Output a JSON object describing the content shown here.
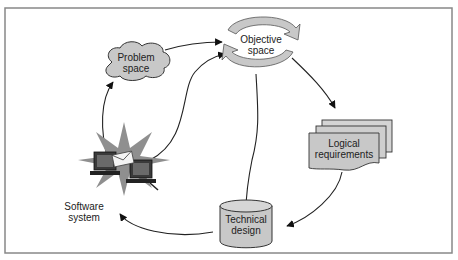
{
  "diagram": {
    "nodes": {
      "problem_space": {
        "line1": "Problem",
        "line2": "space"
      },
      "objective_space": {
        "line1": "Objective",
        "line2": "space"
      },
      "logical_requirements": {
        "line1": "Logical",
        "line2": "requirements"
      },
      "technical_design": {
        "line1": "Technical",
        "line2": "design"
      },
      "software_system": {
        "line1": "Software",
        "line2": "system"
      }
    },
    "edges": [
      {
        "from": "problem_space",
        "to": "objective_space"
      },
      {
        "from": "software_system",
        "to": "problem_space"
      },
      {
        "from": "software_system",
        "to": "objective_space"
      },
      {
        "from": "objective_space",
        "to": "logical_requirements"
      },
      {
        "from": "objective_space",
        "to": "technical_design"
      },
      {
        "from": "logical_requirements",
        "to": "technical_design"
      },
      {
        "from": "technical_design",
        "to": "software_system"
      }
    ],
    "colors": {
      "shape_fill": "#c8c8c8",
      "stroke": "#333333",
      "frame": "#888888",
      "starburst": "#8a8a8a"
    }
  }
}
